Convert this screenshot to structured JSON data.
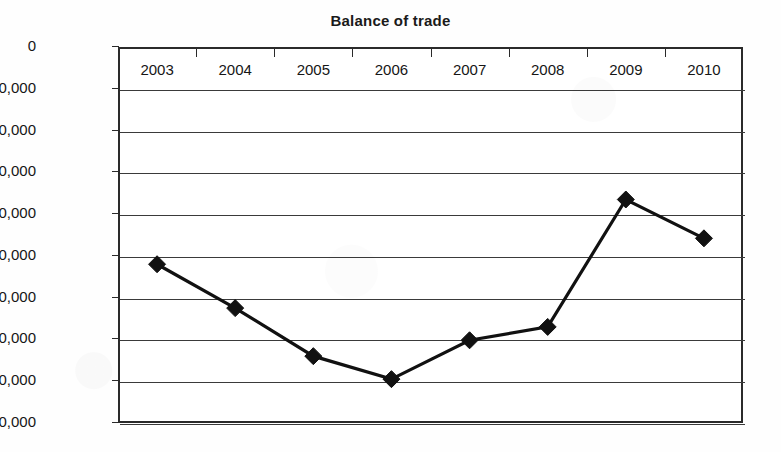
{
  "chart_data": {
    "type": "line",
    "title": "Balance of trade",
    "xlabel": "",
    "ylabel": "",
    "categories": [
      "2003",
      "2004",
      "2005",
      "2006",
      "2007",
      "2008",
      "2009",
      "2010"
    ],
    "values": [
      -520000,
      -625000,
      -740000,
      -795000,
      -702000,
      -670000,
      -365000,
      -458000
    ],
    "series": [
      {
        "name": "Balance of trade",
        "values": [
          -520000,
          -625000,
          -740000,
          -795000,
          -702000,
          -670000,
          -365000,
          -458000
        ]
      }
    ],
    "ylim": [
      -900000,
      0
    ],
    "ytick_values": [
      0,
      -100000,
      -200000,
      -300000,
      -400000,
      -500000,
      -600000,
      -700000,
      -800000,
      -900000
    ],
    "ytick_labels": [
      "0",
      "–100,000",
      "–200,000",
      "–300,000",
      "–400,000",
      "–500,000",
      "–600,000",
      "–700,000",
      "–800,000",
      "–900,000"
    ],
    "grid": true,
    "grid_axis": "y",
    "legend": false,
    "legend_position": "none",
    "marker": "diamond",
    "line_color": "#111111",
    "marker_color": "#111111",
    "grid_color": "#3a3a3a",
    "axis_color": "#2a2a2a",
    "background_color": "#ffffff"
  }
}
